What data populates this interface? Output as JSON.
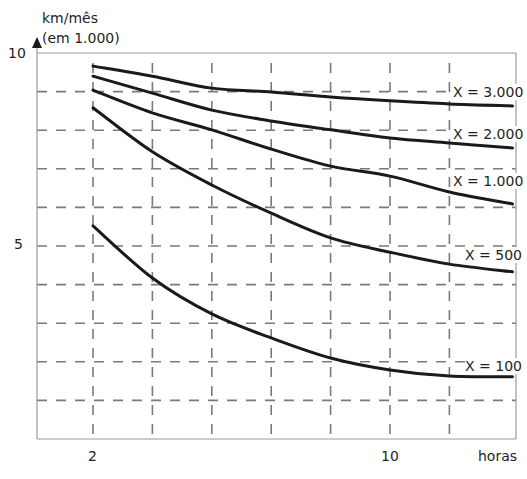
{
  "chart_data": {
    "type": "line",
    "title": "",
    "ylabel": "km/mês (em 1.000)",
    "ylabel_lines": [
      "km/mês",
      "(em 1.000)"
    ],
    "xlabel": "horas",
    "y_ticks": [
      {
        "value": 5,
        "label": "5"
      },
      {
        "value": 10,
        "label": "10"
      }
    ],
    "x_ticks": [
      {
        "value": 2,
        "label": "2"
      },
      {
        "value": 10,
        "label": "10"
      }
    ],
    "ylim": [
      0,
      10
    ],
    "xlim": [
      0.5,
      13.4
    ],
    "grid": true,
    "grid_style": "dashed",
    "y_gridlines": [
      1,
      2,
      3,
      4,
      5,
      6,
      7,
      8,
      9
    ],
    "x_gridlines": [
      2,
      3.6,
      5.2,
      6.8,
      8.4,
      10,
      11.6
    ],
    "x": [
      2,
      3.6,
      5.2,
      6.8,
      8.4,
      10,
      11.6,
      13.3
    ],
    "series": [
      {
        "name": "X = 3.000",
        "values": [
          9.66,
          9.4,
          9.09,
          8.99,
          8.86,
          8.76,
          8.68,
          8.63
        ]
      },
      {
        "name": "X = 2.000",
        "values": [
          9.4,
          8.96,
          8.52,
          8.24,
          8.01,
          7.8,
          7.67,
          7.54
        ]
      },
      {
        "name": "X = 1.000",
        "values": [
          9.04,
          8.45,
          8.01,
          7.51,
          7.07,
          6.81,
          6.4,
          6.09
        ]
      },
      {
        "name": "X = 500",
        "values": [
          8.58,
          7.44,
          6.58,
          5.85,
          5.21,
          4.84,
          4.53,
          4.33
        ]
      },
      {
        "name": "X = 100",
        "values": [
          5.52,
          4.17,
          3.24,
          2.62,
          2.1,
          1.79,
          1.63,
          1.61
        ]
      }
    ],
    "legend": "inline labels at right end of each curve"
  },
  "colors": {
    "curve": "#1a1a1a",
    "grid": "#7a7a7a",
    "axis": "#9a9a9a",
    "text": "#231f20"
  }
}
